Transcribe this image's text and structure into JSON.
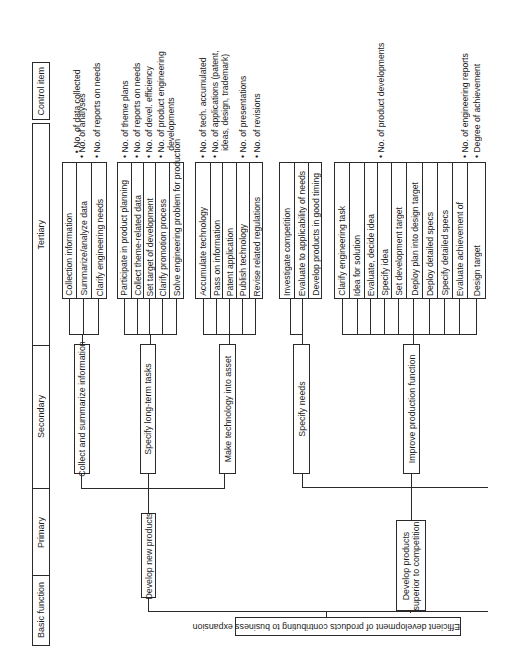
{
  "headers": {
    "control_item": "Control item",
    "tertiary": "Tertiary",
    "secondary": "Secondary",
    "primary": "Primary",
    "basic_function": "Basic function"
  },
  "basic_function": "Efficient development of products contributing to business expansion",
  "primary": [
    {
      "label": "Develop new products",
      "secondary": [
        {
          "label": "Collect and summarize information",
          "tertiary": [
            "Collection information",
            "Summarize/analyze data",
            "Clarify engineering needs"
          ],
          "control_items": [
            "• No. of data collected",
            "• No. of analyses",
            "• No. of reports on needs"
          ]
        },
        {
          "label": "Specify long-term tasks",
          "tertiary": [
            "Participate in product planning",
            "Collect theme-related data",
            "Set target of development",
            "Clarify promotion process",
            "Solve engineering problem for production"
          ],
          "control_items": [
            "• No. of theme plans",
            "• No. of reports on needs",
            "• No. of devel. efficiency",
            "• No. of product engineering\n   developments"
          ]
        },
        {
          "label": "Make technology into asset",
          "tertiary": [
            "Accumulate technology",
            "Pass on information",
            "Patent application",
            "Publish technology",
            "Revise related regulations"
          ],
          "control_items": [
            "• No. of tech. accumulated",
            "• No. of applications (patent,\n   ideas, design, trademark)",
            "• No. of presentations",
            "• No. of revisions"
          ]
        }
      ]
    },
    {
      "label": "Develop products\nsuperior to competition",
      "secondary": [
        {
          "label": "Specify needs",
          "tertiary": [
            "Investigate competition",
            "Evaluate to applicability of needs",
            "Develop products in good timing"
          ],
          "control_items": []
        },
        {
          "label": "Improve production function",
          "tertiary": [
            "Clarify engineering task",
            "Idea for solution",
            "Evaluate, decide idea",
            "Specify idea",
            "Set development target",
            "Deploy plan into design target",
            "Deploy detailed specs",
            "Specify detailed specs",
            "Evaluate achievement of",
            "Design target"
          ],
          "control_items": [
            "• No. of product developments",
            "• No. of engineering reports",
            "• Degree of achievement"
          ]
        }
      ]
    }
  ]
}
